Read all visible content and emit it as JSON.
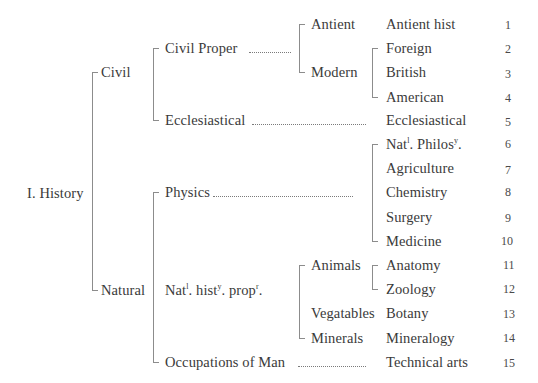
{
  "root": {
    "label": "I. History"
  },
  "level1": {
    "civil": "Civil",
    "natural": "Natural"
  },
  "level2": {
    "civil_proper": "Civil Proper",
    "ecclesiastical": "Ecclesiastical",
    "physics": "Physics",
    "nat_hist_prop": {
      "a": "Nat",
      "a_sup": "l",
      "b": ". hist",
      "b_sup": "y",
      "c": ". prop",
      "c_sup": "r",
      "d": "."
    },
    "occupations": "Occupations of Man"
  },
  "level3": {
    "antient": "Antient",
    "modern": "Modern",
    "animals": "Animals",
    "vegatables": "Vegatables",
    "minerals": "Minerals"
  },
  "leaves": [
    {
      "label": "Antient hist",
      "number": "1"
    },
    {
      "label": "Foreign",
      "number": "2"
    },
    {
      "label": "British",
      "number": "3"
    },
    {
      "label": "American",
      "number": "4"
    },
    {
      "label": "Ecclesiastical",
      "number": "5"
    },
    {
      "label": "Nat. Philos.",
      "parts": {
        "a": "Nat",
        "a_sup": "l",
        "b": ". Philos",
        "b_sup": "y",
        "c": "."
      },
      "number": "6"
    },
    {
      "label": "Agriculture",
      "number": "7"
    },
    {
      "label": "Chemistry",
      "number": "8"
    },
    {
      "label": "Surgery",
      "number": "9"
    },
    {
      "label": "Medicine",
      "number": "10"
    },
    {
      "label": "Anatomy",
      "number": "11"
    },
    {
      "label": "Zoology",
      "number": "12"
    },
    {
      "label": "Botany",
      "number": "13"
    },
    {
      "label": "Mineralogy",
      "number": "14"
    },
    {
      "label": "Technical arts",
      "number": "15"
    }
  ],
  "colors": {
    "text": "#3a3a3a",
    "lines": "#8c8c8c",
    "background": "#ffffff"
  }
}
